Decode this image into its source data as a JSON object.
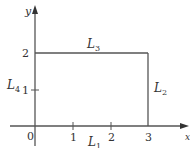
{
  "diagram": {
    "type": "coordinate-plane-rectangle-path",
    "axes": {
      "x_label": "x",
      "y_label": "y",
      "x_ticks": [
        "1",
        "2",
        "3"
      ],
      "y_ticks": [
        "1",
        "2"
      ],
      "origin_label": "0"
    },
    "segments": [
      {
        "name": "L1",
        "letter": "L",
        "sub": "1",
        "from": [
          0,
          0
        ],
        "to": [
          3,
          0
        ]
      },
      {
        "name": "L2",
        "letter": "L",
        "sub": "2",
        "from": [
          3,
          0
        ],
        "to": [
          3,
          2
        ]
      },
      {
        "name": "L3",
        "letter": "L",
        "sub": "3",
        "from": [
          3,
          2
        ],
        "to": [
          0,
          2
        ]
      },
      {
        "name": "L4",
        "letter": "L",
        "sub": "4",
        "from": [
          0,
          2
        ],
        "to": [
          0,
          0
        ]
      }
    ],
    "colors": {
      "line": "#555555",
      "text": "#333333"
    }
  }
}
